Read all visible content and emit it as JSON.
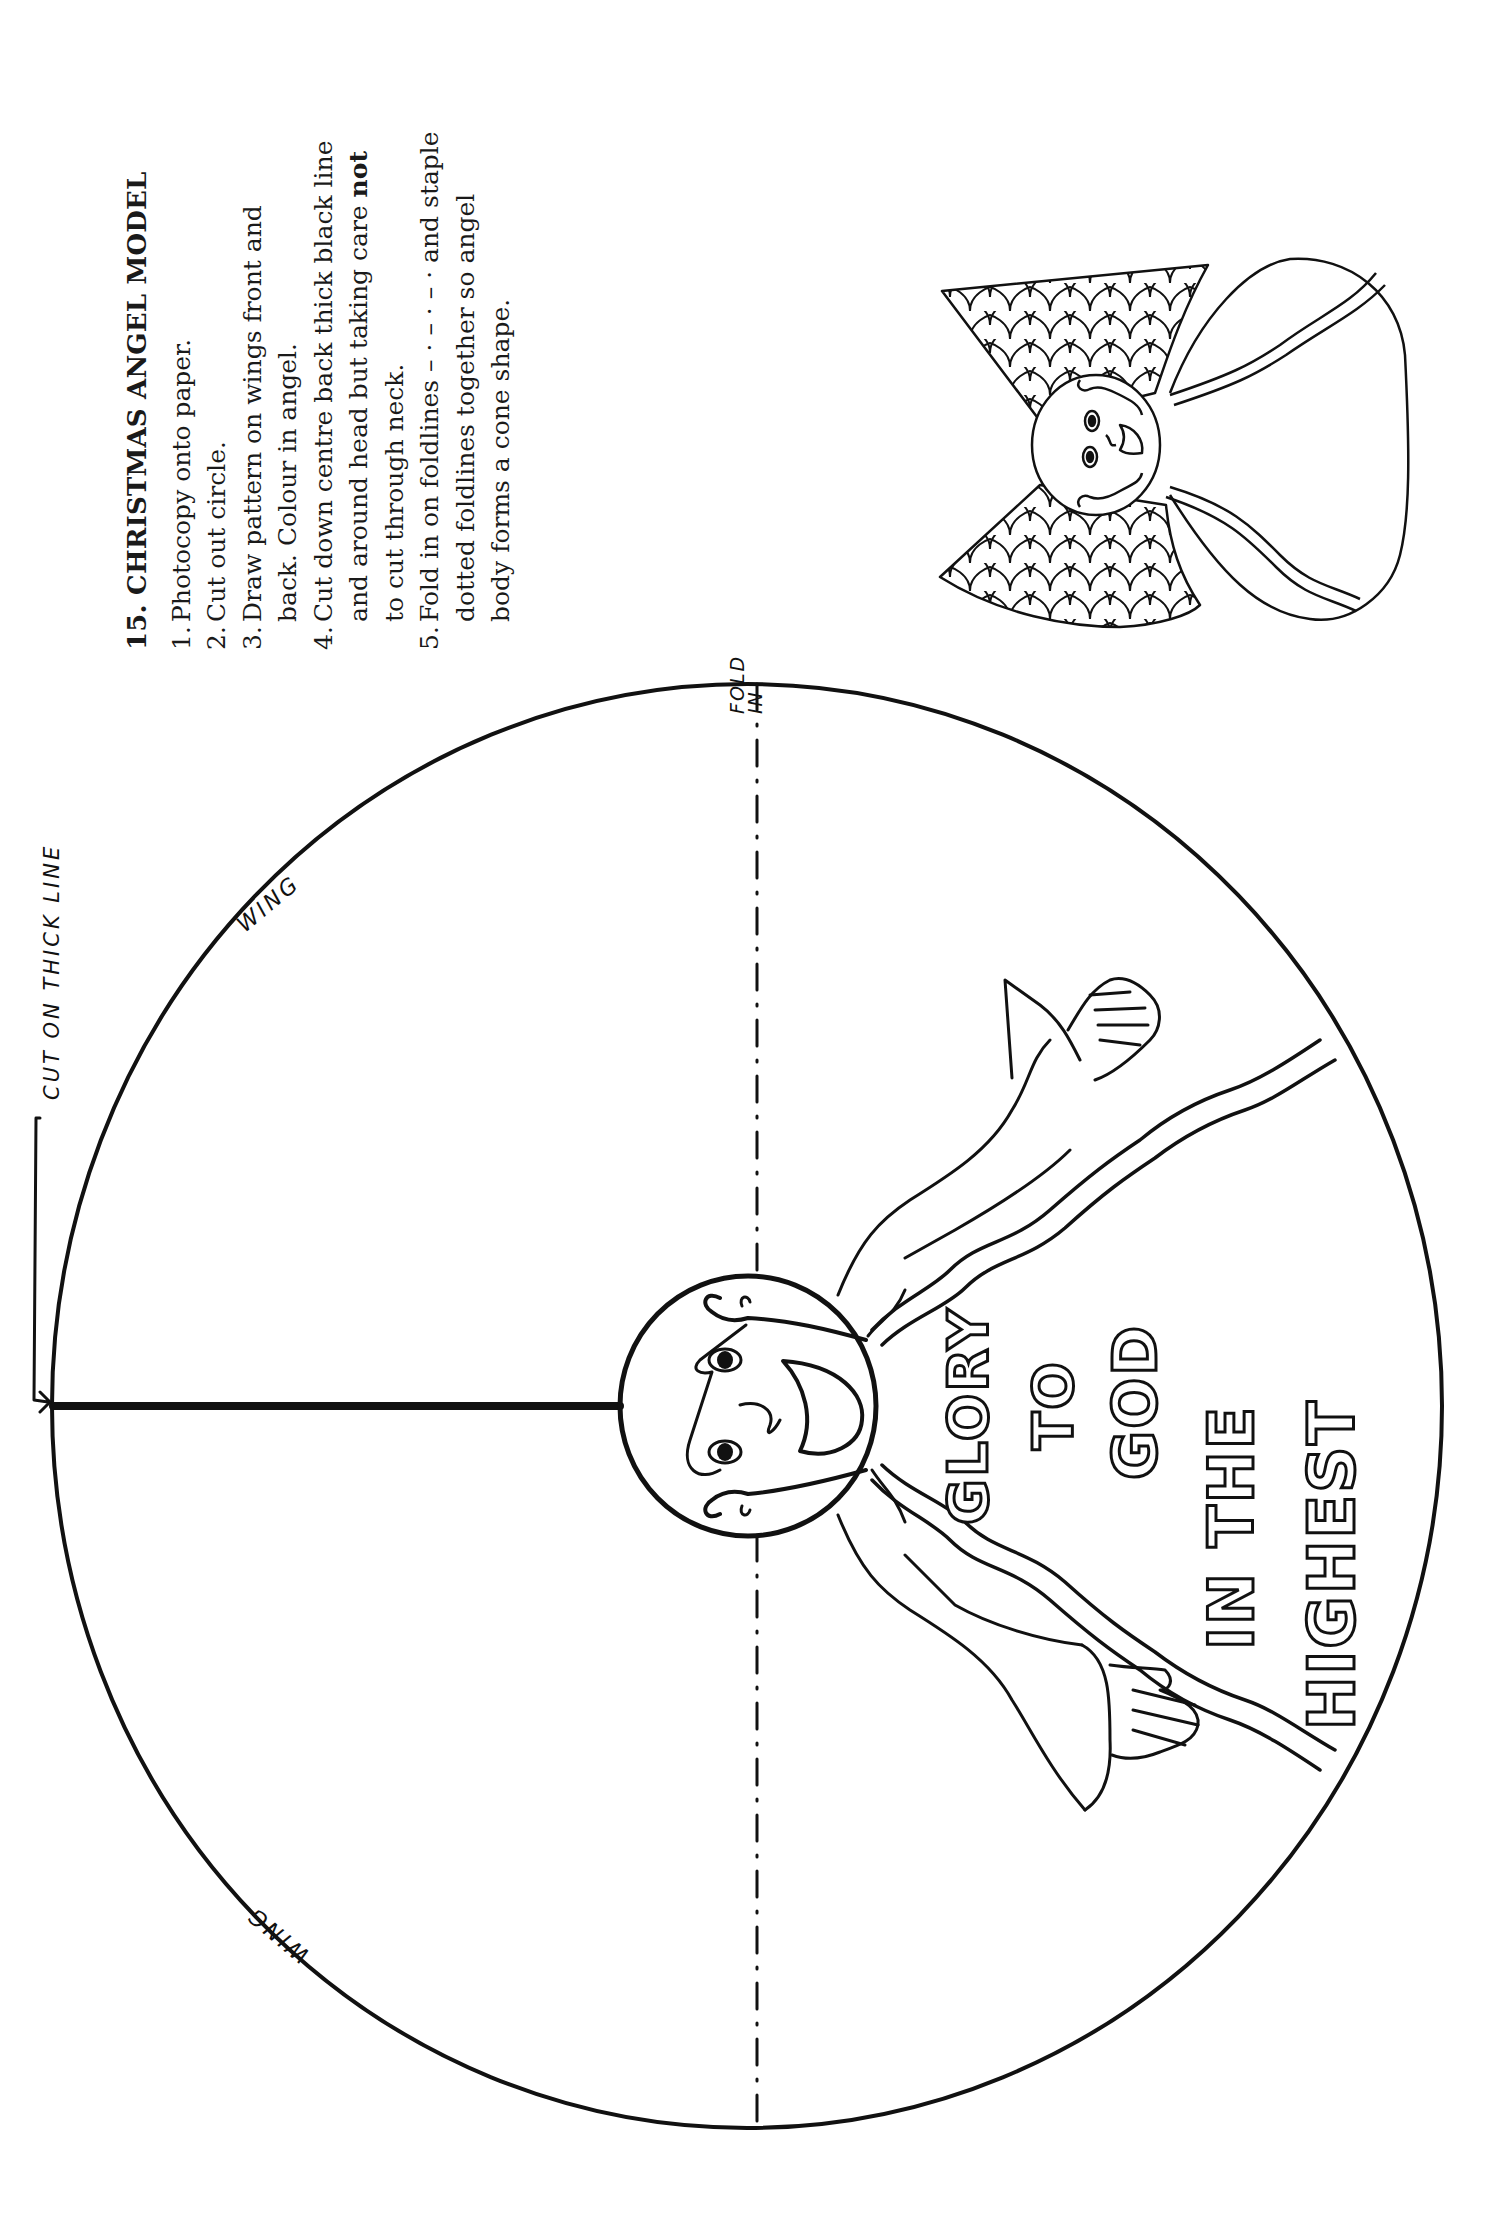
{
  "instructions": {
    "title": "15. CHRISTMAS ANGEL MODEL",
    "steps": [
      {
        "num": "1.",
        "text": "Photocopy onto paper."
      },
      {
        "num": "2.",
        "text": "Cut out circle."
      },
      {
        "num": "3.",
        "text": "Draw pattern on wings front and back. Colour in angel."
      },
      {
        "num": "4.",
        "text_before": "Cut down centre back thick black line and around head but taking care ",
        "bold": "not",
        "text_after": " to cut through neck."
      },
      {
        "num": "5.",
        "text": "Fold in on foldlines – · – · – · and staple dotted foldlines together so angel body forms a cone shape."
      }
    ]
  },
  "template": {
    "labels": {
      "cut": "CUT ON THICK LINE",
      "fold": "FOLD IN",
      "wing_top": "WING",
      "wing_bottom": "WING"
    },
    "banner_lines": [
      "GLORY",
      "TO",
      "GOD",
      "IN THE",
      "HIGHEST"
    ]
  },
  "colors": {
    "ink": "#111111",
    "paper": "#ffffff"
  }
}
